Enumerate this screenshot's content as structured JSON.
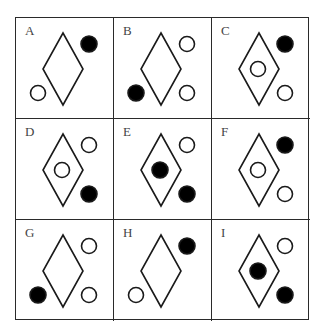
{
  "puzzle": {
    "colors": {
      "line": "#1a1a1a",
      "filled": "#000000",
      "open": "#ffffff",
      "background": "#ffffff"
    },
    "cells": [
      {
        "label": "A",
        "top_right": "filled",
        "bottom_left": "open",
        "bottom_right": "none",
        "inner": "none"
      },
      {
        "label": "B",
        "top_right": "open",
        "bottom_left": "filled",
        "bottom_right": "open",
        "inner": "none"
      },
      {
        "label": "C",
        "top_right": "filled",
        "bottom_left": "none",
        "bottom_right": "open",
        "inner": "open"
      },
      {
        "label": "D",
        "top_right": "open",
        "bottom_left": "none",
        "bottom_right": "filled",
        "inner": "open"
      },
      {
        "label": "E",
        "top_right": "open",
        "bottom_left": "none",
        "bottom_right": "filled",
        "inner": "filled"
      },
      {
        "label": "F",
        "top_right": "filled",
        "bottom_left": "none",
        "bottom_right": "open",
        "inner": "open"
      },
      {
        "label": "G",
        "top_right": "open",
        "bottom_left": "filled",
        "bottom_right": "open",
        "inner": "none"
      },
      {
        "label": "H",
        "top_right": "filled",
        "bottom_left": "open",
        "bottom_right": "none",
        "inner": "none"
      },
      {
        "label": "I",
        "top_right": "open",
        "bottom_left": "none",
        "bottom_right": "filled",
        "inner": "filled"
      }
    ]
  }
}
